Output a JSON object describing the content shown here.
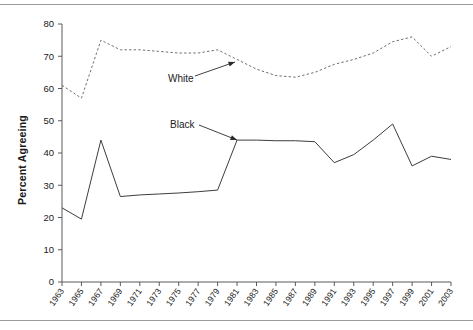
{
  "chart_data": {
    "type": "line",
    "title": "",
    "xlabel": "",
    "ylabel": "Percent Agreeing",
    "ylim": [
      0,
      80
    ],
    "ytick_step": 10,
    "yticks": [
      0,
      10,
      20,
      30,
      40,
      50,
      60,
      70,
      80
    ],
    "xlim": [
      1963,
      2003
    ],
    "xticks": [
      1963,
      1965,
      1967,
      1969,
      1971,
      1973,
      1975,
      1977,
      1979,
      1981,
      1983,
      1985,
      1987,
      1989,
      1991,
      1993,
      1995,
      1997,
      1999,
      2001,
      2003
    ],
    "grid": false,
    "legend_position": "inline-annotations",
    "x": [
      1963,
      1965,
      1967,
      1969,
      1971,
      1973,
      1975,
      1977,
      1979,
      1981,
      1983,
      1985,
      1987,
      1989,
      1991,
      1993,
      1995,
      1997,
      1999,
      2001,
      2003
    ],
    "series": [
      {
        "name": "White",
        "style": "dashed",
        "color": "#6e6e6e",
        "values": [
          61,
          57,
          75,
          72,
          72,
          71.5,
          71,
          71,
          72,
          69,
          66,
          64,
          63.5,
          65,
          67.5,
          69,
          71,
          74.5,
          76,
          70,
          73
        ]
      },
      {
        "name": "Black",
        "style": "solid",
        "color": "#3d3d3d",
        "values": [
          23,
          19.5,
          44,
          26.5,
          27,
          27.3,
          27.6,
          28,
          28.5,
          44,
          44,
          43.8,
          43.8,
          43.5,
          37,
          39.5,
          44,
          49,
          36,
          39,
          38
        ]
      }
    ],
    "annotations": [
      {
        "text": "White",
        "series": "White",
        "label_x": 168,
        "label_y": 82,
        "arrow_from_x": 195,
        "arrow_from_y": 76,
        "arrow_to_x": 235,
        "arrow_to_y": 62
      },
      {
        "text": "Black",
        "series": "Black",
        "label_x": 170,
        "label_y": 128,
        "arrow_from_x": 199,
        "arrow_from_y": 125,
        "arrow_to_x": 237,
        "arrow_to_y": 140
      }
    ]
  }
}
